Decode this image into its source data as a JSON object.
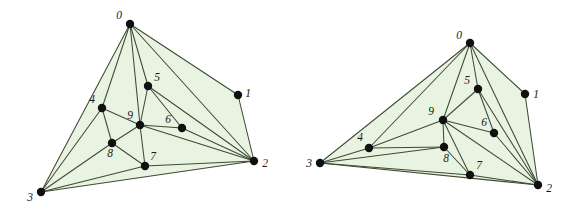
{
  "figure": {
    "width": 581,
    "height": 210,
    "background_color": "#ffffff",
    "face_fill_color": "#e9f3e1",
    "edge_color": "#3d4a35",
    "vertex_color": "#101010",
    "label_color": "#1a1a1a",
    "vertex_radius": 4.2
  },
  "graphs": [
    {
      "name": "left-graph",
      "caption": "",
      "vertices": [
        {
          "id": "0",
          "label": "0",
          "x": 130,
          "y": 24,
          "label_dx": -11,
          "label_dy": -8
        },
        {
          "id": "1",
          "label": "1",
          "x": 238,
          "y": 95,
          "label_dx": 10,
          "label_dy": -1
        },
        {
          "id": "2",
          "label": "2",
          "x": 254,
          "y": 161,
          "label_dx": 11,
          "label_dy": 3
        },
        {
          "id": "3",
          "label": "3",
          "x": 41,
          "y": 192,
          "label_dx": -11,
          "label_dy": 6
        },
        {
          "id": "4",
          "label": "4",
          "x": 102,
          "y": 108,
          "label_dx": -10,
          "label_dy": -8
        },
        {
          "id": "5",
          "label": "5",
          "x": 148,
          "y": 86,
          "label_dx": 9,
          "label_dy": -8
        },
        {
          "id": "6",
          "label": "6",
          "x": 182,
          "y": 128,
          "label_dx": -14,
          "label_dy": -8
        },
        {
          "id": "7",
          "label": "7",
          "x": 145,
          "y": 166,
          "label_dx": 8,
          "label_dy": -9
        },
        {
          "id": "8",
          "label": "8",
          "x": 112,
          "y": 143,
          "label_dx": -2,
          "label_dy": 11
        },
        {
          "id": "9",
          "label": "9",
          "x": 140,
          "y": 125,
          "label_dx": -10,
          "label_dy": -9
        }
      ],
      "faces": [
        [
          "0",
          "1",
          "2"
        ],
        [
          "0",
          "3",
          "2"
        ]
      ],
      "edges": [
        [
          "0",
          "1"
        ],
        [
          "0",
          "2"
        ],
        [
          "0",
          "3"
        ],
        [
          "0",
          "4"
        ],
        [
          "0",
          "5"
        ],
        [
          "0",
          "9"
        ],
        [
          "1",
          "2"
        ],
        [
          "2",
          "5"
        ],
        [
          "2",
          "6"
        ],
        [
          "2",
          "9"
        ],
        [
          "2",
          "7"
        ],
        [
          "2",
          "3"
        ],
        [
          "3",
          "4"
        ],
        [
          "3",
          "8"
        ],
        [
          "3",
          "7"
        ],
        [
          "4",
          "9"
        ],
        [
          "4",
          "8"
        ],
        [
          "5",
          "9"
        ],
        [
          "5",
          "6"
        ],
        [
          "6",
          "9"
        ],
        [
          "7",
          "8"
        ],
        [
          "7",
          "9"
        ],
        [
          "8",
          "9"
        ]
      ]
    },
    {
      "name": "right-graph",
      "caption": "",
      "vertices": [
        {
          "id": "0",
          "label": "0",
          "x": 470,
          "y": 43,
          "label_dx": -11,
          "label_dy": -7
        },
        {
          "id": "1",
          "label": "1",
          "x": 525,
          "y": 94,
          "label_dx": 11,
          "label_dy": 1
        },
        {
          "id": "2",
          "label": "2",
          "x": 538,
          "y": 185,
          "label_dx": 11,
          "label_dy": 4
        },
        {
          "id": "3",
          "label": "3",
          "x": 320,
          "y": 163,
          "label_dx": -11,
          "label_dy": 1
        },
        {
          "id": "4",
          "label": "4",
          "x": 369,
          "y": 148,
          "label_dx": -9,
          "label_dy": -10
        },
        {
          "id": "5",
          "label": "5",
          "x": 478,
          "y": 89,
          "label_dx": -11,
          "label_dy": -8
        },
        {
          "id": "6",
          "label": "6",
          "x": 494,
          "y": 133,
          "label_dx": -10,
          "label_dy": -10
        },
        {
          "id": "7",
          "label": "7",
          "x": 470,
          "y": 175,
          "label_dx": 9,
          "label_dy": -9
        },
        {
          "id": "8",
          "label": "8",
          "x": 444,
          "y": 147,
          "label_dx": 2,
          "label_dy": 12
        },
        {
          "id": "9",
          "label": "9",
          "x": 443,
          "y": 120,
          "label_dx": -12,
          "label_dy": -8
        }
      ],
      "faces": [
        [
          "0",
          "1",
          "2"
        ],
        [
          "0",
          "3",
          "2"
        ]
      ],
      "edges": [
        [
          "0",
          "1"
        ],
        [
          "0",
          "2"
        ],
        [
          "0",
          "3"
        ],
        [
          "0",
          "4"
        ],
        [
          "0",
          "5"
        ],
        [
          "0",
          "9"
        ],
        [
          "1",
          "2"
        ],
        [
          "2",
          "5"
        ],
        [
          "2",
          "6"
        ],
        [
          "2",
          "9"
        ],
        [
          "2",
          "7"
        ],
        [
          "2",
          "3"
        ],
        [
          "3",
          "4"
        ],
        [
          "3",
          "8"
        ],
        [
          "3",
          "7"
        ],
        [
          "4",
          "9"
        ],
        [
          "4",
          "8"
        ],
        [
          "5",
          "9"
        ],
        [
          "5",
          "6"
        ],
        [
          "6",
          "9"
        ],
        [
          "7",
          "8"
        ],
        [
          "7",
          "9"
        ],
        [
          "8",
          "9"
        ]
      ]
    }
  ]
}
